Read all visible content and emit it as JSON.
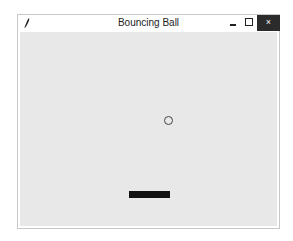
{
  "window": {
    "title": "Bouncing Ball",
    "controls": {
      "minimize": "minimize",
      "maximize": "maximize",
      "close": "×"
    }
  },
  "canvas": {
    "background": "#e8e8e8",
    "ball": {
      "shape": "circle-outline",
      "color": "#444444"
    },
    "paddle": {
      "color": "#111111"
    }
  }
}
